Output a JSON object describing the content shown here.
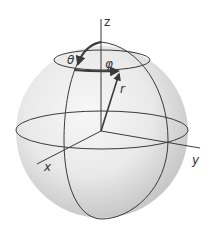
{
  "diagram": {
    "labels": {
      "z_axis": "z",
      "x_axis": "x",
      "y_axis": "y",
      "radius": "r",
      "polar_angle": "θ",
      "azimuth_angle": "φ"
    },
    "colors": {
      "line": "#3a3a3a",
      "sphere_light": "#f4f4f4",
      "sphere_dark": "#c9c9c9",
      "background": "#ffffff"
    }
  }
}
